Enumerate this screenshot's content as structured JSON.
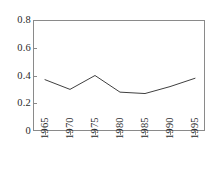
{
  "chart_data": {
    "type": "line",
    "title": "",
    "subtitle": "",
    "xlabel": "",
    "ylabel": "",
    "categories": [
      "1965",
      "1970",
      "1975",
      "1980",
      "1985",
      "1990",
      "1995"
    ],
    "x": [
      1965,
      1970,
      1975,
      1980,
      1985,
      1990,
      1995
    ],
    "values": [
      0.37,
      0.3,
      0.4,
      0.28,
      0.27,
      0.32,
      0.38
    ],
    "series": [
      {
        "name": "series-1",
        "values": [
          0.37,
          0.3,
          0.4,
          0.28,
          0.27,
          0.32,
          0.38
        ]
      }
    ],
    "xlim": [
      1965,
      1995
    ],
    "ylim": [
      0,
      0.8
    ],
    "yticks": [
      "0",
      "0.2",
      "0.4",
      "0.6",
      "0.8"
    ],
    "ytick_values": [
      0,
      0.2,
      0.4,
      0.6,
      0.8
    ],
    "xticks": [
      "1965",
      "1970",
      "1975",
      "1980",
      "1985",
      "1990",
      "1995"
    ],
    "grid": false,
    "legend": false,
    "legend_position": "none",
    "markers": false,
    "xtick_rotation": 90,
    "annotations": [],
    "colors": {
      "line": "#404040",
      "axis": "#8a8a8a",
      "text": "#2a2a2a",
      "background": "#ffffff"
    }
  }
}
